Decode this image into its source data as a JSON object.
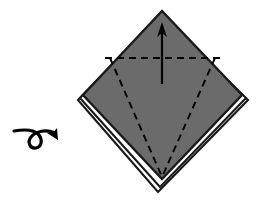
{
  "figure": {
    "title": "Origami step: turn the model over",
    "kind": "origami-diagram",
    "background_color": "#ffffff",
    "canvas": {
      "width": 257,
      "height": 205
    }
  },
  "colors": {
    "paper_front": "#6b6b6b",
    "paper_back": "#ffffff",
    "outline": "#1a1a1a",
    "fold_line": "#000000",
    "arrow": "#000000"
  },
  "shapes": {
    "back_layer_2": {
      "name": "lower-hidden-layer",
      "points": "78,100 158,18 248,100 158,192",
      "fill": "#ffffff",
      "stroke": "#1a1a1a",
      "stroke_width": 2.1
    },
    "back_layer_1": {
      "name": "middle-hidden-layer",
      "points": "80,98 160,15 246,98 160,187",
      "fill": "#ffffff",
      "stroke": "#1a1a1a",
      "stroke_width": 2.1
    },
    "front_layer": {
      "name": "top-gray-layer",
      "points": "83,95 162,11 242,95 162,179",
      "fill": "#6b6b6b",
      "stroke": "#1a1a1a",
      "stroke_width": 2.4
    }
  },
  "fold_lines": [
    {
      "name": "horizontal-valley-fold",
      "type": "valley",
      "style": "dashed",
      "from": [
        105,
        58
      ],
      "to": [
        220,
        58
      ],
      "dash": "7,5"
    },
    {
      "name": "left-diagonal-fold",
      "type": "valley",
      "style": "dashed",
      "from": [
        110,
        58
      ],
      "to": [
        162,
        177
      ],
      "dash": "7,5"
    },
    {
      "name": "right-diagonal-fold",
      "type": "valley",
      "style": "dashed",
      "from": [
        215,
        58
      ],
      "to": [
        162,
        177
      ],
      "dash": "7,5"
    }
  ],
  "arrows": {
    "fold_up_arrow": {
      "name": "fold-up-arrow",
      "direction": "up",
      "shaft_from": [
        162,
        84
      ],
      "shaft_to": [
        162,
        30
      ],
      "head_points": "162,22 157,37 162,33 167,37"
    },
    "turn_over_arrow": {
      "name": "turn-over-arrow",
      "meaning": "turn the model over",
      "path": "M 14,131 C 26,129 34,130 38,134 C 43,139 42,147 36,148 C 30,149 27,142 31,137 C 36,131 46,129 55,133",
      "head_points": "58,140 57,128 53,133 47,133"
    }
  },
  "labels": {
    "step_caption": "",
    "notes": ""
  }
}
